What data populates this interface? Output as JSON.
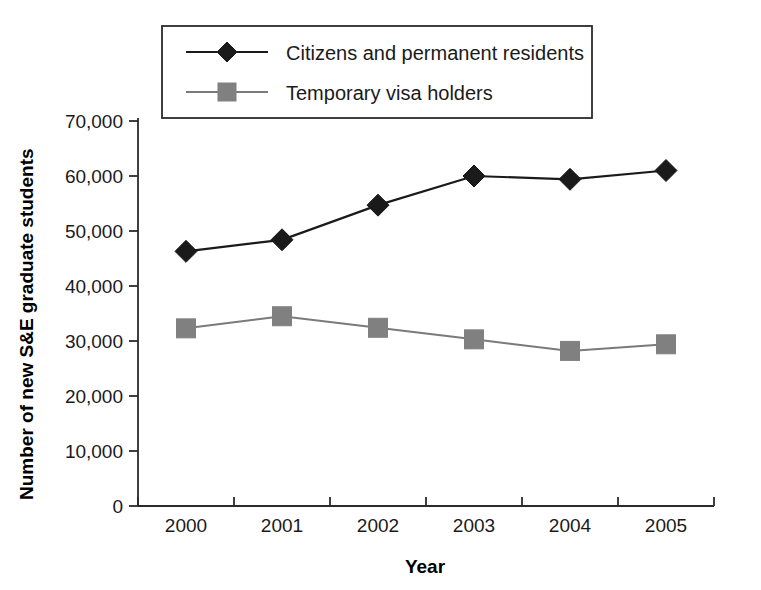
{
  "chart_data": {
    "type": "line",
    "title": "",
    "xlabel": "Year",
    "ylabel": "Number of new S&E graduate students",
    "categories": [
      "2000",
      "2001",
      "2002",
      "2003",
      "2004",
      "2005"
    ],
    "x": [
      2000,
      2001,
      2002,
      2003,
      2004,
      2005
    ],
    "ylim": [
      0,
      70000
    ],
    "ytick_step": 10000,
    "yticks": [
      0,
      10000,
      20000,
      30000,
      40000,
      50000,
      60000,
      70000
    ],
    "ytick_labels": [
      "0",
      "10,000",
      "20,000",
      "30,000",
      "40,000",
      "50,000",
      "60,000",
      "70,000"
    ],
    "grid": false,
    "legend_position": "top-center",
    "series": [
      {
        "name": "Citizens and permanent residents",
        "marker": "diamond",
        "color": "#1a1a1a",
        "line_color": "#1a1a1a",
        "values": [
          46300,
          48400,
          54700,
          60000,
          59400,
          61000
        ]
      },
      {
        "name": "Temporary visa holders",
        "marker": "square",
        "color": "#808080",
        "line_color": "#7a7a7a",
        "values": [
          32300,
          34500,
          32400,
          30300,
          28200,
          29400
        ]
      }
    ]
  },
  "axes": {
    "y_axis_title": "Number of new S&E graduate students",
    "x_axis_title": "Year"
  },
  "legend": {
    "entries": [
      {
        "label": "Citizens and permanent residents",
        "marker": "diamond-marker-icon"
      },
      {
        "label": "Temporary visa holders",
        "marker": "square-marker-icon"
      }
    ]
  },
  "colors": {
    "series_1": "#1a1a1a",
    "series_2": "#808080",
    "axis": "#2b2b2b",
    "background": "#ffffff"
  }
}
